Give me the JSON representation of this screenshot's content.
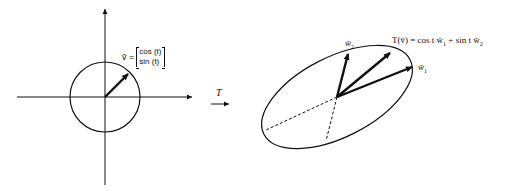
{
  "left_panel": {
    "vector_label_prefix": "v̄ =",
    "matrix_row1": "cos (t)",
    "matrix_row2": "sin (t)"
  },
  "transform": {
    "label": "T"
  },
  "right_panel": {
    "w1_label": "w̄",
    "w1_sub": "1",
    "w2_label": "w̄",
    "w2_sub": "2",
    "tv_label": "T(v̄) = cos t w̄",
    "tv_sub1": "1",
    "tv_mid": " + sin t w̄",
    "tv_sub2": "2"
  }
}
